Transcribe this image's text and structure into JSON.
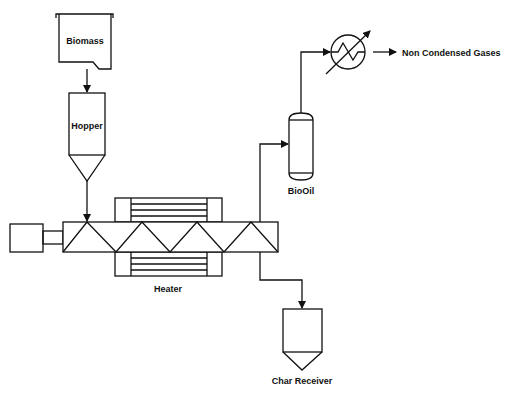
{
  "diagram": {
    "labels": {
      "biomass": "Biomass",
      "hopper": "Hopper",
      "heater": "Heater",
      "biooil": "BioOil",
      "non_condensed_gases": "Non Condensed Gases",
      "char_receiver": "Char Receiver"
    },
    "colors": {
      "stroke": "#111111",
      "background": "#ffffff"
    },
    "components": [
      {
        "id": "biomass-bin",
        "label": "Biomass"
      },
      {
        "id": "hopper",
        "label": "Hopper"
      },
      {
        "id": "motor",
        "label": ""
      },
      {
        "id": "screw-reactor",
        "label": ""
      },
      {
        "id": "heater",
        "label": "Heater"
      },
      {
        "id": "biooil-separator",
        "label": "BioOil"
      },
      {
        "id": "condenser",
        "label": ""
      },
      {
        "id": "char-receiver",
        "label": "Char Receiver"
      }
    ],
    "flows": [
      {
        "from": "Biomass",
        "to": "Hopper"
      },
      {
        "from": "Hopper",
        "to": "Screw reactor"
      },
      {
        "from": "Screw reactor",
        "to": "BioOil"
      },
      {
        "from": "BioOil",
        "to": "Condenser"
      },
      {
        "from": "Condenser",
        "to": "Non Condensed Gases"
      },
      {
        "from": "Screw reactor",
        "to": "Char Receiver"
      }
    ]
  }
}
